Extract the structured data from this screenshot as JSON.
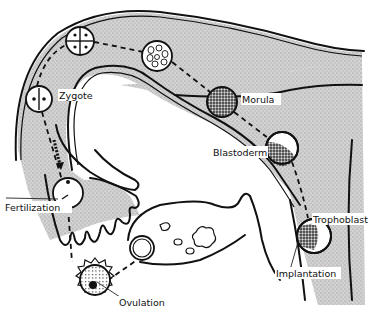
{
  "diagram": {
    "labels": {
      "zygote": "Zygote",
      "morula": "Morula",
      "blastoderm": "Blastoderm",
      "fertilization": "Fertilization",
      "trophoblast": "Trophoblast",
      "implantation": "Implantation",
      "ovulation": "Ovulation"
    },
    "stages": [
      {
        "id": "ovulation",
        "label": "Ovulation",
        "cells": "ovum with corona"
      },
      {
        "id": "fertilization",
        "label": "Fertilization",
        "cells": "1"
      },
      {
        "id": "zygote",
        "label": "Zygote",
        "cells": "2"
      },
      {
        "id": "four-cell",
        "label": "",
        "cells": "4"
      },
      {
        "id": "multi-cell",
        "label": "",
        "cells": "many"
      },
      {
        "id": "morula",
        "label": "Morula",
        "cells": "solid mass"
      },
      {
        "id": "blastoderm",
        "label": "Blastoderm",
        "cells": "hollow"
      },
      {
        "id": "trophoblast",
        "label": "Trophoblast",
        "cells": "implanting"
      }
    ],
    "colors": {
      "line": "#111111",
      "tissue": "#c8c8c8",
      "background": "#ffffff"
    }
  }
}
